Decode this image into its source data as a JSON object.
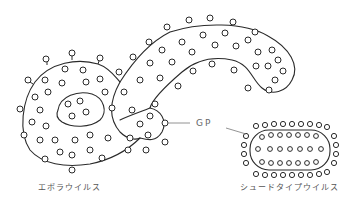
{
  "diagram": {
    "labels": {
      "ebola": "エボラウイルス",
      "shoot": "シュードタイプウイルス",
      "gp": "GP"
    },
    "colors": {
      "stroke": "#2a2a2a",
      "text": "#555555",
      "leader": "#777777",
      "background": "#ffffff"
    },
    "elements": [
      {
        "id": "ebola-virus",
        "shape": "S-shaped filamentous particle with surface GP spikes",
        "label_key": "ebola"
      },
      {
        "id": "pseudotype-virus",
        "shape": "rounded rectangle (capsule) particle with surface GP spikes",
        "label_key": "shoot"
      },
      {
        "id": "gp-callout",
        "shape": "label with two leader lines pointing to GP spikes on both viruses",
        "label_key": "gp"
      }
    ]
  }
}
